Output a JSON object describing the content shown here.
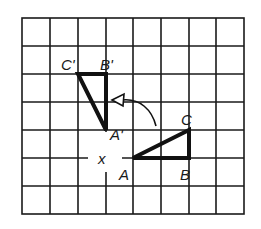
{
  "diagram": {
    "type": "rotation-on-grid",
    "grid": {
      "columns": 8,
      "rows": 7,
      "line_color": "#1a1a1a"
    },
    "center_label": "x",
    "original_triangle": {
      "vertices": [
        {
          "label": "A",
          "grid": [
            4,
            5
          ]
        },
        {
          "label": "B",
          "grid": [
            6,
            5
          ]
        },
        {
          "label": "C",
          "grid": [
            6,
            4
          ]
        }
      ]
    },
    "image_triangle": {
      "vertices": [
        {
          "label": "A'",
          "grid": [
            3,
            4
          ]
        },
        {
          "label": "B'",
          "grid": [
            3,
            2
          ]
        },
        {
          "label": "C'",
          "grid": [
            2,
            2
          ]
        }
      ]
    },
    "arrow": {
      "direction": "counterclockwise",
      "meaning": "rotation 90°"
    },
    "labels": {
      "A": "A",
      "B": "B",
      "C": "C",
      "A_prime": "A'",
      "B_prime": "B'",
      "C_prime": "C'",
      "x": "x"
    }
  }
}
